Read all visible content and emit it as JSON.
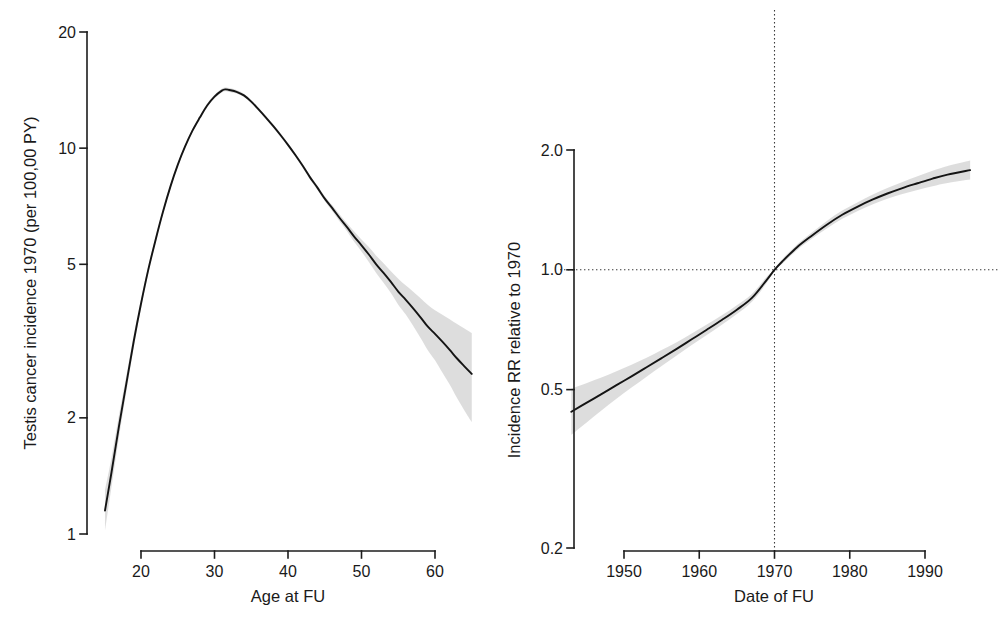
{
  "figure": {
    "background_color": "#ffffff",
    "line_color": "#141414",
    "ci_band_color": "#d4d4d4",
    "reference_line_color": "#3a3a3a"
  },
  "chart_data": [
    {
      "id": "panel-a",
      "type": "line",
      "title": "",
      "xlabel": "Age at FU",
      "ylabel": "Testis cancer incidence 1970 (per 100,00 PY)",
      "yscale": "log",
      "xscale": "linear",
      "grid": false,
      "legend": "none",
      "xlim": [
        15,
        65
      ],
      "ylim": [
        1,
        20
      ],
      "xticks": [
        20,
        30,
        40,
        50,
        60
      ],
      "xticklabels": [
        "20",
        "30",
        "40",
        "50",
        "60"
      ],
      "yticks": [
        1,
        2,
        5,
        10,
        20
      ],
      "yticklabels": [
        "1",
        "2",
        "5",
        "10",
        "20"
      ],
      "series": [
        {
          "name": "Testis cancer incidence 1970",
          "x": [
            15.1,
            16,
            17,
            18,
            19,
            20,
            21,
            22,
            23,
            24,
            25,
            26,
            27,
            28,
            29,
            30,
            31,
            31.5,
            32,
            33,
            34,
            35,
            36,
            37,
            38,
            39,
            40,
            41,
            42,
            43,
            44,
            45,
            46,
            47,
            48,
            49,
            50,
            51,
            52,
            53,
            54,
            55,
            56,
            57,
            58,
            59,
            60,
            61,
            62,
            63,
            64,
            65
          ],
          "y": [
            1.15,
            1.45,
            1.9,
            2.45,
            3.15,
            3.95,
            4.85,
            5.8,
            6.85,
            7.95,
            9.05,
            10.1,
            11.1,
            12.0,
            12.9,
            13.6,
            14.1,
            14.2,
            14.15,
            14.0,
            13.7,
            13.2,
            12.6,
            12.0,
            11.4,
            10.8,
            10.2,
            9.6,
            9.0,
            8.4,
            7.9,
            7.4,
            7.0,
            6.6,
            6.25,
            5.9,
            5.6,
            5.3,
            5.0,
            4.75,
            4.5,
            4.25,
            4.05,
            3.85,
            3.65,
            3.45,
            3.3,
            3.15,
            3.0,
            2.85,
            2.72,
            2.6
          ],
          "ci_lower": [
            1.02,
            1.33,
            1.78,
            2.33,
            3.03,
            3.84,
            4.74,
            5.69,
            6.74,
            7.84,
            8.94,
            9.99,
            10.99,
            11.88,
            12.76,
            13.45,
            13.94,
            14.04,
            13.99,
            13.85,
            13.56,
            13.07,
            12.48,
            11.88,
            11.29,
            10.69,
            10.1,
            9.5,
            8.9,
            8.3,
            7.8,
            7.29,
            6.88,
            6.46,
            6.1,
            5.72,
            5.4,
            5.07,
            4.75,
            4.48,
            4.21,
            3.93,
            3.71,
            3.47,
            3.23,
            3.0,
            2.82,
            2.62,
            2.44,
            2.25,
            2.09,
            1.95
          ],
          "ci_upper": [
            1.3,
            1.58,
            2.03,
            2.57,
            3.27,
            4.06,
            4.96,
            5.91,
            6.96,
            8.06,
            9.16,
            10.21,
            11.21,
            12.12,
            13.04,
            13.75,
            14.26,
            14.36,
            14.31,
            14.15,
            13.84,
            13.33,
            12.72,
            12.12,
            11.51,
            10.91,
            10.3,
            9.7,
            9.1,
            8.5,
            8.0,
            7.51,
            7.12,
            6.74,
            6.4,
            6.08,
            5.8,
            5.54,
            5.26,
            5.03,
            4.8,
            4.59,
            4.41,
            4.25,
            4.09,
            3.93,
            3.8,
            3.7,
            3.6,
            3.5,
            3.41,
            3.32
          ]
        }
      ]
    },
    {
      "id": "panel-b",
      "type": "line",
      "title": "",
      "xlabel": "Date of FU",
      "ylabel": "Incidence RR relative to 1970",
      "yscale": "log",
      "xscale": "linear",
      "grid": false,
      "legend": "none",
      "xlim": [
        1943,
        1996
      ],
      "ylim": [
        0.2,
        2.0
      ],
      "xticks": [
        1950,
        1960,
        1970,
        1980,
        1990
      ],
      "xticklabels": [
        "1950",
        "1960",
        "1970",
        "1980",
        "1990"
      ],
      "yticks": [
        0.2,
        0.5,
        1.0,
        2.0
      ],
      "yticklabels": [
        "0.2",
        "0.5",
        "1.0",
        "2.0"
      ],
      "reference_lines": [
        {
          "orientation": "vertical",
          "value": 1970,
          "style": "dotted"
        },
        {
          "orientation": "horizontal",
          "value": 1.0,
          "style": "dotted"
        }
      ],
      "series": [
        {
          "name": "Incidence RR relative to 1970",
          "x": [
            1943,
            1945,
            1947,
            1949,
            1951,
            1953,
            1955,
            1957,
            1959,
            1961,
            1963,
            1965,
            1967,
            1969,
            1970,
            1971,
            1973,
            1975,
            1977,
            1979,
            1981,
            1983,
            1985,
            1987,
            1989,
            1991,
            1993,
            1996
          ],
          "y": [
            0.44,
            0.463,
            0.487,
            0.513,
            0.54,
            0.569,
            0.6,
            0.633,
            0.669,
            0.707,
            0.748,
            0.794,
            0.85,
            0.945,
            1.0,
            1.048,
            1.14,
            1.22,
            1.3,
            1.375,
            1.44,
            1.5,
            1.555,
            1.605,
            1.65,
            1.695,
            1.735,
            1.78
          ],
          "ci_lower": [
            0.385,
            0.413,
            0.443,
            0.474,
            0.506,
            0.539,
            0.573,
            0.609,
            0.647,
            0.686,
            0.728,
            0.774,
            0.831,
            0.929,
            1.0,
            1.034,
            1.122,
            1.198,
            1.272,
            1.343,
            1.404,
            1.459,
            1.508,
            1.55,
            1.587,
            1.622,
            1.653,
            1.685
          ],
          "ci_upper": [
            0.503,
            0.519,
            0.536,
            0.556,
            0.577,
            0.601,
            0.629,
            0.658,
            0.692,
            0.729,
            0.769,
            0.815,
            0.87,
            0.962,
            1.0,
            1.062,
            1.158,
            1.243,
            1.329,
            1.409,
            1.477,
            1.543,
            1.605,
            1.663,
            1.717,
            1.773,
            1.823,
            1.882
          ]
        }
      ]
    }
  ],
  "panels": {
    "left": {
      "name": "Panel A",
      "ylabel": "Testis cancer incidence 1970 (per 100,00 PY)",
      "xlabel": "Age at FU",
      "yticklabels": [
        "20",
        "10",
        "5",
        "2",
        "1"
      ],
      "xticklabels": [
        "20",
        "30",
        "40",
        "50",
        "60"
      ]
    },
    "right": {
      "name": "Panel B",
      "ylabel": "Incidence RR relative to 1970",
      "xlabel": "Date of FU",
      "yticklabels": [
        "2.0",
        "1.0",
        "0.5",
        "0.2"
      ],
      "xticklabels": [
        "1950",
        "1960",
        "1970",
        "1980",
        "1990"
      ]
    }
  }
}
